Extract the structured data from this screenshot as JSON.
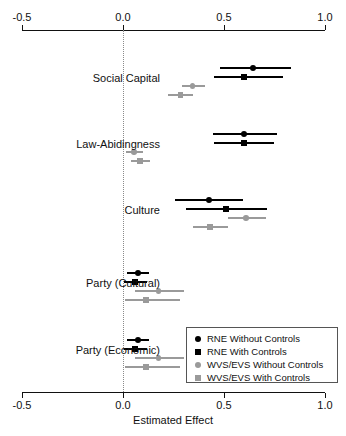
{
  "chart_data": {
    "type": "scatter",
    "title": "",
    "xlabel": "Estimated Effect",
    "ylabel": "",
    "xlim": [
      -0.5,
      1.0
    ],
    "xticks": [
      -0.5,
      0.0,
      0.5,
      1.0
    ],
    "xtick_labels": [
      "-0.5",
      "0.0",
      "0.5",
      "1.0"
    ],
    "grid": false,
    "reference_line": 0.0,
    "legend_position": "bottom-right",
    "categories": [
      "Social Capital",
      "Law-Abidingness",
      "Culture",
      "Party (Cultural)",
      "Party (Economic)"
    ],
    "series": [
      {
        "name": "RNE Without Controls",
        "marker": "circle",
        "color": "#000000",
        "values": [
          0.645,
          0.6,
          0.425,
          0.075,
          0.075
        ],
        "ci_low": [
          0.48,
          0.445,
          0.255,
          0.02,
          0.02
        ],
        "ci_high": [
          0.83,
          0.76,
          0.595,
          0.13,
          0.13
        ]
      },
      {
        "name": "RNE With Controls",
        "marker": "square",
        "color": "#000000",
        "values": [
          0.6,
          0.6,
          0.51,
          0.06,
          0.06
        ],
        "ci_low": [
          0.45,
          0.45,
          0.31,
          0.005,
          0.005
        ],
        "ci_high": [
          0.79,
          0.75,
          0.715,
          0.12,
          0.12
        ]
      },
      {
        "name": "WVS/EVS Without Controls",
        "marker": "circle",
        "color": "#9a9a9a",
        "values": [
          0.345,
          0.055,
          0.61,
          0.175,
          0.175
        ],
        "ci_low": [
          0.29,
          0.015,
          0.52,
          0.06,
          0.06
        ],
        "ci_high": [
          0.405,
          0.1,
          0.71,
          0.3,
          0.3
        ]
      },
      {
        "name": "WVS/EVS With Controls",
        "marker": "square",
        "color": "#9a9a9a",
        "values": [
          0.285,
          0.085,
          0.43,
          0.115,
          0.115
        ],
        "ci_low": [
          0.225,
          0.04,
          0.345,
          0.01,
          0.01
        ],
        "ci_high": [
          0.345,
          0.135,
          0.52,
          0.28,
          0.28
        ]
      }
    ]
  },
  "legend": {
    "items": [
      {
        "label": "RNE Without Controls",
        "marker": "circle",
        "color": "#000000"
      },
      {
        "label": "RNE With Controls",
        "marker": "square",
        "color": "#000000"
      },
      {
        "label": "WVS/EVS Without Controls",
        "marker": "circle",
        "color": "#9a9a9a"
      },
      {
        "label": "WVS/EVS With Controls",
        "marker": "square",
        "color": "#9a9a9a"
      }
    ]
  },
  "layout": {
    "plot_left_px": 22,
    "plot_right_px": 325,
    "top_axis_y_px": 30,
    "bottom_axis_y_px": 392,
    "category_centers_px": [
      78,
      144,
      210,
      283,
      350
    ],
    "row_offsets_px": [
      -10,
      -1,
      8,
      17
    ],
    "legend_box": {
      "x": 186,
      "y": 327,
      "w": 152,
      "h": 56
    }
  }
}
